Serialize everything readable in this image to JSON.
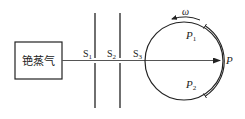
{
  "diagram": {
    "source_box": {
      "label": "铯蒸气"
    },
    "slits": [
      {
        "label": "S",
        "sub": "1"
      },
      {
        "label": "S",
        "sub": "2"
      },
      {
        "label": "S",
        "sub": "3"
      }
    ],
    "rotation_label": "ω",
    "points": [
      {
        "label": "P",
        "sub": "1"
      },
      {
        "label": "P",
        "sub": "2"
      },
      {
        "label": "P",
        "sub": ""
      }
    ],
    "colors": {
      "stroke": "#222222",
      "beam": "#555555"
    }
  }
}
